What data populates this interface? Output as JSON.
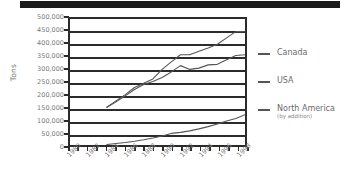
{
  "banner": {
    "name": "top-black-bar",
    "color": "#1b1b1b"
  },
  "chart_data": {
    "type": "line",
    "title": "",
    "xlabel": "",
    "ylabel": "Tons",
    "xlim": [
      1980,
      1999
    ],
    "ylim": [
      0,
      500000
    ],
    "grid": true,
    "legend_position": "right",
    "y_ticks": [
      0,
      50000,
      100000,
      150000,
      200000,
      250000,
      300000,
      350000,
      400000,
      450000,
      500000
    ],
    "y_ticklabels": [
      "0",
      "50,000",
      "100,000",
      "150,000",
      "200,000",
      "250,000",
      "300,000",
      "350,000",
      "400,000",
      "450,000",
      "500,000"
    ],
    "x_ticks": [
      1980,
      1981,
      1982,
      1983,
      1984,
      1985,
      1986,
      1987,
      1988,
      1989,
      1990,
      1991,
      1992,
      1993,
      1994,
      1995,
      1996,
      1997,
      1998,
      1999
    ],
    "x_ticklabels": [
      "1980",
      "1982",
      "1984",
      "1986",
      "1988",
      "1990",
      "1992",
      "1994",
      "1996",
      "1998"
    ],
    "x_ticklabel_years": [
      1980,
      1982,
      1984,
      1986,
      1988,
      1990,
      1992,
      1994,
      1996,
      1998
    ],
    "series": [
      {
        "name": "Canada",
        "color": "#555555",
        "x": [
          1984,
          1985,
          1986,
          1987,
          1988,
          1989,
          1990,
          1991,
          1992,
          1993,
          1994,
          1995,
          1996,
          1997,
          1998,
          1999
        ],
        "values": [
          150000,
          175000,
          200000,
          228000,
          245000,
          262000,
          300000,
          330000,
          358000,
          358000,
          372000,
          385000,
          400000,
          425000,
          450000,
          450000
        ]
      },
      {
        "name": "USA",
        "color": "#555555",
        "x": [
          1984,
          1985,
          1986,
          1987,
          1988,
          1989,
          1990,
          1991,
          1992,
          1993,
          1994,
          1995,
          1996,
          1997,
          1998,
          1999
        ],
        "values": [
          150000,
          172000,
          195000,
          220000,
          240000,
          252000,
          268000,
          290000,
          315000,
          300000,
          305000,
          318000,
          320000,
          338000,
          355000,
          358000
        ]
      },
      {
        "name": "North America",
        "sublabel": "(by addition)",
        "color": "#555555",
        "x": [
          1984,
          1985,
          1986,
          1987,
          1988,
          1989,
          1990,
          1991,
          1992,
          1993,
          1994,
          1995,
          1996,
          1997,
          1998,
          1999
        ],
        "values": [
          2000,
          6000,
          10000,
          15000,
          21000,
          28000,
          36000,
          46000,
          50000,
          56000,
          64000,
          73000,
          83000,
          95000,
          105000,
          120000
        ]
      }
    ]
  },
  "legend": {
    "entries": [
      {
        "label": "Canada",
        "sublabel": ""
      },
      {
        "label": "USA",
        "sublabel": ""
      },
      {
        "label": "North America",
        "sublabel": "(by addition)"
      }
    ]
  }
}
